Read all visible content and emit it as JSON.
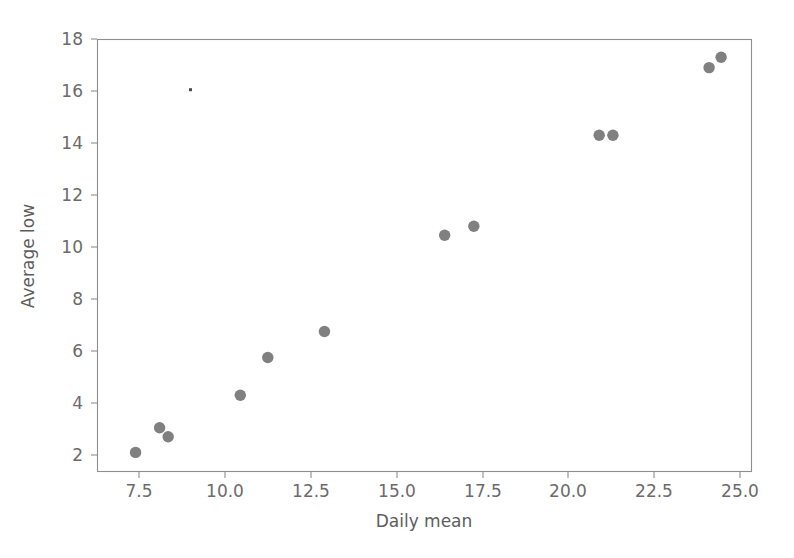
{
  "figure": {
    "background_color": "#ffffff",
    "marker_color": "#808080",
    "axis_color": "#8e8e8e",
    "text_color": "#6b6b6b"
  },
  "chart_data": {
    "type": "scatter",
    "title": "",
    "xlabel": "Daily mean",
    "ylabel": "Average low",
    "xlim": [
      6.6,
      25.4
    ],
    "ylim": [
      1.3,
      18.4
    ],
    "grid": false,
    "legend": null,
    "xticks": [
      7.5,
      10.0,
      12.5,
      15.0,
      17.5,
      20.0,
      22.5,
      25.0
    ],
    "xticklabels": [
      "7.5",
      "10.0",
      "12.5",
      "15.0",
      "17.5",
      "20.0",
      "22.5",
      "25.0"
    ],
    "yticks": [
      2,
      4,
      6,
      8,
      10,
      12,
      14,
      16,
      18
    ],
    "yticklabels": [
      "2",
      "4",
      "6",
      "8",
      "10",
      "12",
      "14",
      "16",
      "18"
    ],
    "marker": "circle",
    "marker_size": 7,
    "marker_color": "#808080",
    "x": [
      7.4,
      8.1,
      8.35,
      10.45,
      11.25,
      12.9,
      16.4,
      17.25,
      20.9,
      21.3,
      24.1,
      24.45
    ],
    "y": [
      2.1,
      3.05,
      2.7,
      4.3,
      5.75,
      6.75,
      10.45,
      10.8,
      14.3,
      14.3,
      16.9,
      17.3
    ],
    "points": [
      {
        "x": 7.4,
        "y": 2.1
      },
      {
        "x": 8.1,
        "y": 3.05
      },
      {
        "x": 8.35,
        "y": 2.7
      },
      {
        "x": 10.45,
        "y": 4.3
      },
      {
        "x": 11.25,
        "y": 5.75
      },
      {
        "x": 12.9,
        "y": 6.75
      },
      {
        "x": 16.4,
        "y": 10.45
      },
      {
        "x": 17.25,
        "y": 10.8
      },
      {
        "x": 20.9,
        "y": 14.3
      },
      {
        "x": 21.3,
        "y": 14.3
      },
      {
        "x": 24.1,
        "y": 16.9
      },
      {
        "x": 24.45,
        "y": 17.3
      }
    ],
    "artifacts": [
      {
        "x": 9.0,
        "y": 16.05,
        "kind": "speck"
      }
    ]
  }
}
